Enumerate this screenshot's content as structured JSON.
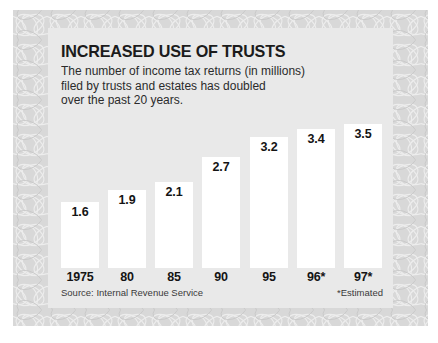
{
  "chart_data": {
    "type": "bar",
    "title": "INCREASED USE OF TRUSTS",
    "subtitle_lines": [
      "The number of income tax returns (in millions)",
      "filed by trusts and estates has doubled",
      "over the past 20 years."
    ],
    "categories": [
      "1975",
      "80",
      "85",
      "90",
      "95",
      "96*",
      "97*"
    ],
    "values": [
      1.6,
      1.9,
      2.1,
      2.7,
      3.2,
      3.4,
      3.5
    ],
    "value_labels": [
      "1.6",
      "1.9",
      "2.1",
      "2.7",
      "3.2",
      "3.4",
      "3.5"
    ],
    "xlabel": "",
    "ylabel": "Number of income tax returns (in millions)",
    "ylim": [
      0,
      3.9
    ],
    "grid": false,
    "legend": false,
    "source": "Source: Internal Revenue Service",
    "footnote": "*Estimated",
    "colors": {
      "bar_fill": "#ffffff",
      "plot_background": "#e9e9e9",
      "panel_background": "#d8d8d8",
      "page_background": "#ffffff",
      "text": "#141414"
    }
  }
}
